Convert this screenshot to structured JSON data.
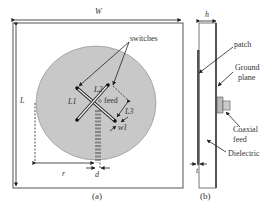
{
  "figure": {
    "panel_a": {
      "caption": "(a)",
      "labels": {
        "W": "W",
        "L": "L",
        "switches": "switches",
        "L1": "L1",
        "L2": "L2",
        "L3": "L3",
        "feed": "feed",
        "w1": "w1",
        "r": "r",
        "d": "d"
      }
    },
    "panel_b": {
      "caption": "(b)",
      "labels": {
        "h": "h",
        "patch": "patch",
        "ground_plane_1": "Ground",
        "ground_plane_2": "plane",
        "coaxial_1": "Coaxial",
        "coaxial_2": "feed",
        "dielectric": "Dielectric",
        "t": "t"
      }
    },
    "colors": {
      "patch_fill": "#c8c8c8",
      "line": "#222222",
      "ground_square": "#555555"
    }
  }
}
